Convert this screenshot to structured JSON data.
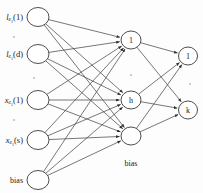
{
  "figure": {
    "type": "neural-network-diagram",
    "title": "",
    "background_color": "#fdfdfd",
    "node_stroke_color": "#3a3a3a",
    "edge_color": "#4a4a4a",
    "text_color": "#1a1a1a"
  },
  "input_layer": {
    "name": "input-layer",
    "x": 38,
    "node_rx": 11,
    "node_ry": 9.5,
    "nodes": [
      {
        "id": "in-l-1",
        "label": "",
        "y": 17,
        "side_label": "l",
        "sub": "e",
        "subsub": "1",
        "suffix": "(1)",
        "italic": true
      },
      {
        "id": "in-l-d",
        "label": "",
        "y": 54,
        "side_label": "l",
        "sub": "e",
        "subsub": "1",
        "suffix": "(d)",
        "italic": true
      },
      {
        "id": "in-x-1",
        "label": "",
        "y": 100,
        "side_label": "x",
        "sub": "e",
        "subsub": "1",
        "suffix": "(1)",
        "italic": true
      },
      {
        "id": "in-x-s",
        "label": "",
        "y": 140,
        "side_label": "x",
        "sub": "e",
        "subsub": "1",
        "suffix": "(s)",
        "italic": true
      },
      {
        "id": "in-bias",
        "label": "",
        "y": 180,
        "side_label": "bias",
        "sub": "",
        "subsub": "",
        "suffix": "",
        "italic": false
      }
    ]
  },
  "hidden_layer": {
    "name": "hidden-layer",
    "x": 131,
    "node_rx": 10,
    "node_ry": 9,
    "caption": "bias",
    "caption_x": 131,
    "caption_y": 163,
    "nodes": [
      {
        "id": "hid-1",
        "label": "1",
        "y": 40,
        "receives_input": true
      },
      {
        "id": "hid-h",
        "label": "h",
        "y": 100,
        "receives_input": true
      },
      {
        "id": "hid-bias",
        "label": "",
        "y": 136,
        "receives_input": true
      }
    ]
  },
  "output_layer": {
    "name": "output-layer",
    "x": 188,
    "node_rx": 9.5,
    "node_ry": 9,
    "nodes": [
      {
        "id": "out-1",
        "label": "1",
        "y": 56
      },
      {
        "id": "out-k",
        "label": "k",
        "y": 110
      }
    ]
  },
  "ellipses": [
    {
      "name": "input-ellipsis-upper",
      "x": 14,
      "y": 37,
      "dots": 1
    },
    {
      "name": "input-ellipsis-lower",
      "x": 14,
      "y": 120,
      "dots": 1
    },
    {
      "name": "node-ellipsis-upper",
      "x": 34,
      "y": 78,
      "dots": 1
    },
    {
      "name": "hidden-ellipsis",
      "x": 131,
      "y": 75,
      "dots": 1
    },
    {
      "name": "output-ellipsis",
      "x": 190,
      "y": 84,
      "dots": 1
    }
  ],
  "edges": {
    "input_to_hidden": [
      [
        "in-l-1",
        "hid-1"
      ],
      [
        "in-l-1",
        "hid-h"
      ],
      [
        "in-l-1",
        "hid-bias"
      ],
      [
        "in-l-d",
        "hid-1"
      ],
      [
        "in-l-d",
        "hid-h"
      ],
      [
        "in-l-d",
        "hid-bias"
      ],
      [
        "in-x-1",
        "hid-1"
      ],
      [
        "in-x-1",
        "hid-h"
      ],
      [
        "in-x-1",
        "hid-bias"
      ],
      [
        "in-x-s",
        "hid-1"
      ],
      [
        "in-x-s",
        "hid-h"
      ],
      [
        "in-x-s",
        "hid-bias"
      ],
      [
        "in-bias",
        "hid-1"
      ],
      [
        "in-bias",
        "hid-h"
      ],
      [
        "in-bias",
        "hid-bias"
      ]
    ],
    "hidden_to_output": [
      [
        "hid-1",
        "out-1"
      ],
      [
        "hid-1",
        "out-k"
      ],
      [
        "hid-h",
        "out-1"
      ],
      [
        "hid-h",
        "out-k"
      ],
      [
        "hid-bias",
        "out-1"
      ],
      [
        "hid-bias",
        "out-k"
      ]
    ]
  }
}
